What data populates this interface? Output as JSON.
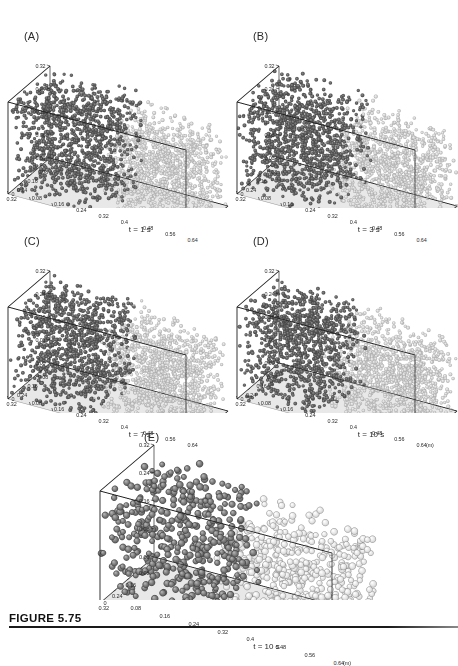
{
  "figure": {
    "caption_label": "FIGURE 5.75",
    "axis_unit": "(m)",
    "colors": {
      "dark_particle": "#5d5d5d",
      "light_particle": "#c9c9c9",
      "floor": "#e8e8e8",
      "box_line": "#1a1a1a",
      "text": "#1f1f1f",
      "page_background": "#ffffff"
    }
  },
  "chart_data": {
    "type": "scatter",
    "title": "FIGURE 5.75",
    "xlabel": "(m)",
    "ylabel": "",
    "zlabel": "",
    "grid": false,
    "legend": "none",
    "axes": {
      "height_ticks": [
        "0.32",
        "0.24",
        "0.16",
        "0.08",
        "0.00"
      ],
      "height_values": [
        0.32,
        0.24,
        0.16,
        0.08,
        0.0
      ],
      "width_ticks": [
        "0.08",
        "0.16",
        "0.24",
        "0.32"
      ],
      "width_values": [
        0.08,
        0.16,
        0.24,
        0.32
      ],
      "length_ticks": [
        "0.64",
        "0.56",
        "0.48",
        "0.4",
        "0.32",
        "0.24",
        "0.16",
        "0.08",
        "0"
      ],
      "length_values": [
        0.64,
        0.56,
        0.48,
        0.4,
        0.32,
        0.24,
        0.16,
        0.08,
        0.0
      ],
      "height_range": [
        0.0,
        0.32
      ],
      "width_range": [
        0.0,
        0.32
      ],
      "length_range": [
        0.0,
        0.64
      ]
    },
    "panels": [
      {
        "id": "A",
        "label": "(A)",
        "time_label": "t = 1 s",
        "time_seconds": 1,
        "particle_style": "fine",
        "particle_count": 2200,
        "dark_fraction": 0.52,
        "bed_height_fraction": 0.97,
        "show_unit": false
      },
      {
        "id": "B",
        "label": "(B)",
        "time_label": "t = 3 s",
        "time_seconds": 3,
        "particle_style": "fine",
        "particle_count": 2200,
        "dark_fraction": 0.5,
        "bed_height_fraction": 0.95,
        "show_unit": false
      },
      {
        "id": "C",
        "label": "(C)",
        "time_label": "t = 7 s",
        "time_seconds": 7,
        "particle_style": "fine",
        "particle_count": 2200,
        "dark_fraction": 0.49,
        "bed_height_fraction": 0.94,
        "show_unit": false
      },
      {
        "id": "D",
        "label": "(D)",
        "time_label": "t = 10 s",
        "time_seconds": 10,
        "particle_style": "fine",
        "particle_count": 2200,
        "dark_fraction": 0.48,
        "bed_height_fraction": 0.93,
        "show_unit": true
      },
      {
        "id": "E",
        "label": "(E)",
        "time_label": "t = 10 s",
        "time_seconds": 10,
        "particle_style": "coarse",
        "particle_count": 980,
        "dark_fraction": 0.47,
        "bed_height_fraction": 0.92,
        "show_unit": true
      }
    ]
  }
}
